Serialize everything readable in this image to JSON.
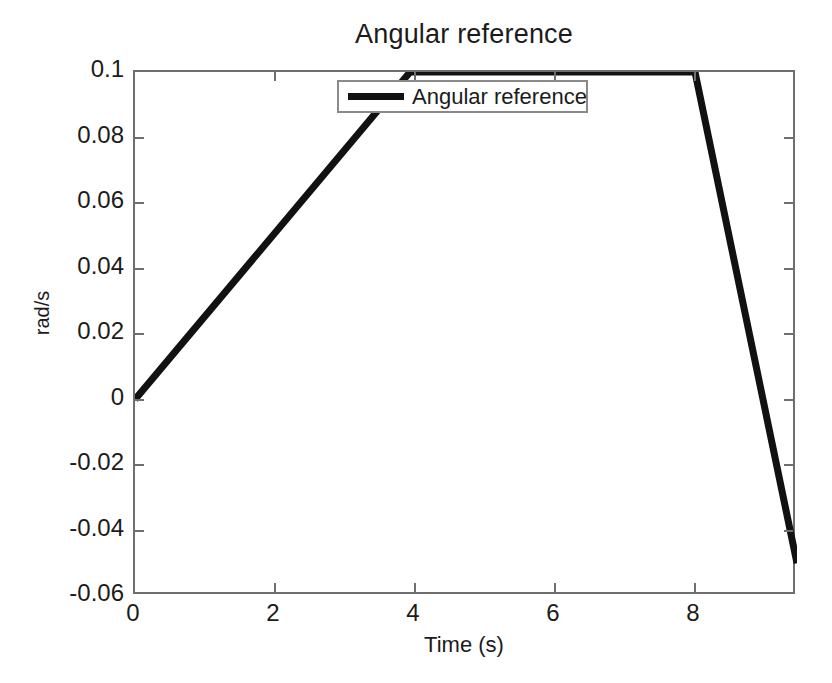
{
  "chart_data": {
    "type": "line",
    "title": "Angular reference",
    "xlabel": "Time (s)",
    "ylabel": "rad/s",
    "xlim": [
      0,
      9.457
    ],
    "ylim": [
      -0.06,
      0.1
    ],
    "xticks": [
      0,
      2,
      4,
      6,
      8
    ],
    "xtick_labels": [
      "0",
      "2",
      "4",
      "6",
      "8"
    ],
    "yticks": [
      0.1,
      0.08,
      0.06,
      0.04,
      0.02,
      0,
      -0.02,
      -0.04,
      -0.06
    ],
    "ytick_labels": [
      "0.1",
      "0.08",
      "0.06",
      "0.04",
      "0.02",
      "0",
      "-0.02",
      "-0.04",
      "-0.06"
    ],
    "grid": false,
    "legend_position": "top-center-inside",
    "series": [
      {
        "name": "Angular reference",
        "color": "#111111",
        "linewidth": 7,
        "x": [
          0,
          3.93,
          8.0,
          9.457
        ],
        "y": [
          0,
          0.1,
          0.1,
          -0.05
        ]
      }
    ]
  },
  "legend": {
    "entries": [
      {
        "label": "Angular reference",
        "color": "#111111"
      }
    ]
  },
  "axes": {
    "box_color": "#6f6f6f",
    "tick_color": "#6f6f6f"
  }
}
